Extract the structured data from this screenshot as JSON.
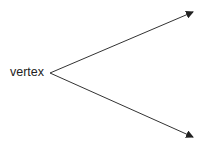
{
  "diagram": {
    "type": "angle-rays",
    "vertex_label": "vertex",
    "vertex": {
      "x": 50,
      "y": 73
    },
    "rays": [
      {
        "name": "upper-ray",
        "end": {
          "x": 193,
          "y": 12
        }
      },
      {
        "name": "lower-ray",
        "end": {
          "x": 193,
          "y": 137
        }
      }
    ],
    "colors": {
      "line": "#333333",
      "background": "#ffffff",
      "text": "#222222"
    }
  }
}
